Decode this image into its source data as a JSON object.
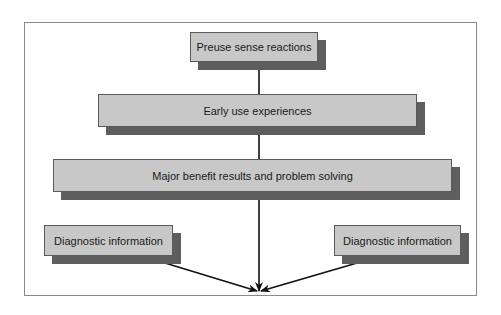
{
  "diagram": {
    "type": "flowchart",
    "colors": {
      "box_fill": "#c8c8c8",
      "box_border": "#5a5a5a",
      "box_shadow": "#5e5e5e",
      "frame_border": "#8a8a8a",
      "line": "#111111",
      "text": "#1a1a1a"
    },
    "nodes": [
      {
        "id": "preuse",
        "label": "Preuse sense reactions"
      },
      {
        "id": "early",
        "label": "Early use experiences"
      },
      {
        "id": "major",
        "label": "Major benefit results and problem solving"
      },
      {
        "id": "diag_left",
        "label": "Diagnostic information"
      },
      {
        "id": "diag_right",
        "label": "Diagnostic information"
      }
    ],
    "edges": [
      {
        "from": "preuse",
        "to": "early",
        "arrow": false
      },
      {
        "from": "early",
        "to": "major",
        "arrow": false
      },
      {
        "from": "major",
        "to": "outcome-point",
        "arrow": true
      },
      {
        "from": "diag_left",
        "to": "outcome-point",
        "arrow": true
      },
      {
        "from": "diag_right",
        "to": "outcome-point",
        "arrow": true
      }
    ]
  }
}
